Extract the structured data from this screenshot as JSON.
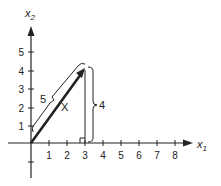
{
  "diagram": {
    "type": "vector-on-cartesian-axes",
    "axes": {
      "x_label": "x",
      "x_label_sub": "1",
      "y_label": "x",
      "y_label_sub": "2",
      "x_ticks": [
        "1",
        "2",
        "3",
        "4",
        "5",
        "6",
        "7",
        "8"
      ],
      "y_ticks": [
        "1",
        "2",
        "3",
        "4",
        "5"
      ]
    },
    "vector": {
      "name": "X",
      "tail": [
        0,
        0
      ],
      "head": [
        3,
        4
      ],
      "length_label": "5",
      "height_label": "4"
    },
    "colors": {
      "ink": "#222222",
      "background": "#ffffff"
    }
  }
}
